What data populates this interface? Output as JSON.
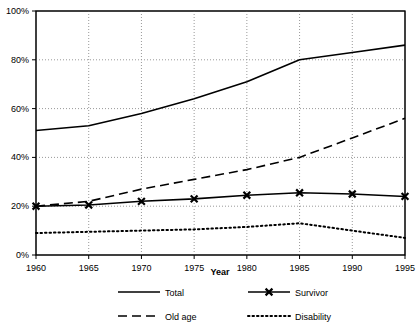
{
  "chart_data": {
    "type": "line",
    "title": "",
    "xlabel": "Year",
    "ylabel": "",
    "x": [
      1960,
      1965,
      1970,
      1975,
      1980,
      1985,
      1990,
      1995
    ],
    "categories": [
      "1960",
      "1965",
      "1970",
      "1975",
      "1980",
      "1985",
      "1990",
      "1995"
    ],
    "xlim": [
      1960,
      1995
    ],
    "ylim": [
      0,
      100
    ],
    "yticks": [
      0,
      20,
      40,
      60,
      80,
      100
    ],
    "ytick_labels": [
      "0%",
      "20%",
      "40%",
      "60%",
      "80%",
      "100%"
    ],
    "xtick_labels": [
      "1960",
      "1965",
      "1970",
      "1975",
      "1980",
      "1985",
      "1990",
      "1995"
    ],
    "grid": "vertical-and-horizontal-dotted",
    "legend_position": "bottom",
    "series": [
      {
        "name": "Total",
        "style": "solid",
        "marker": "none",
        "color": "#000000",
        "values": [
          51,
          53,
          58,
          64,
          71,
          80,
          83,
          86
        ]
      },
      {
        "name": "Survivor",
        "style": "solid",
        "marker": "x",
        "color": "#000000",
        "values": [
          20,
          20.5,
          22,
          23,
          24.5,
          25.5,
          25,
          24
        ]
      },
      {
        "name": "Old age",
        "style": "dashed",
        "marker": "none",
        "color": "#000000",
        "values": [
          20,
          22,
          27,
          31,
          35,
          40,
          48,
          56
        ]
      },
      {
        "name": "Disability",
        "style": "dotted",
        "marker": "none",
        "color": "#000000",
        "values": [
          9,
          9.5,
          10,
          10.5,
          11.5,
          13,
          10,
          7
        ]
      }
    ]
  },
  "axes": {
    "x_title": "Year"
  },
  "legend": {
    "entries": [
      {
        "label": "Total",
        "style": "solid",
        "marker": "none"
      },
      {
        "label": "Survivor",
        "style": "solid",
        "marker": "x"
      },
      {
        "label": "Old age",
        "style": "dashed",
        "marker": "none"
      },
      {
        "label": "Disability",
        "style": "dotted",
        "marker": "none"
      }
    ]
  },
  "colors": {
    "ink": "#000000",
    "grid": "#999999",
    "background": "#ffffff"
  }
}
